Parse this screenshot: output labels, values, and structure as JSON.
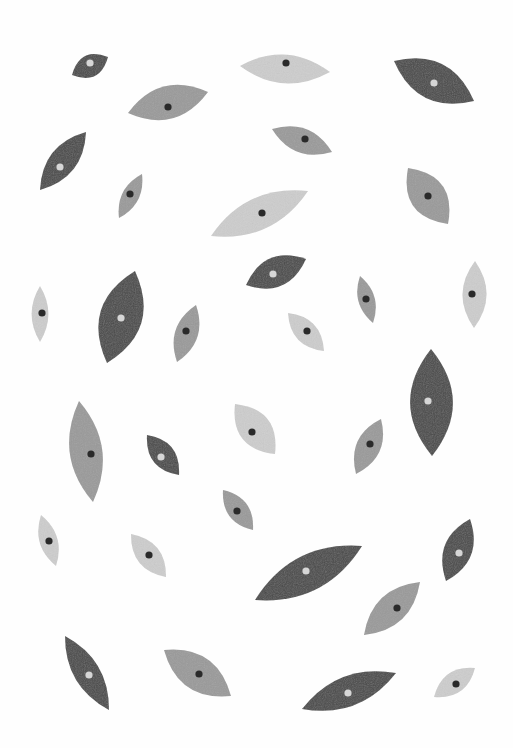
{
  "artwork": {
    "title": "Leaf-eye pattern",
    "background": "#fefefe",
    "palette": {
      "dark": "#4a4a4a",
      "mid": "#9a9a9a",
      "light": "#cdcdcd",
      "dot_dark": "#2a2a2a",
      "dot_light": "#d6d6d6"
    },
    "leaves": [
      {
        "x1": 72,
        "y1": 75,
        "x2": 108,
        "y2": 57,
        "w": 0.55,
        "tone": "dark",
        "dot": "light",
        "dx": 90,
        "dy": 63
      },
      {
        "x1": 240,
        "y1": 66,
        "x2": 330,
        "y2": 72,
        "w": 0.32,
        "tone": "light",
        "dot": "dark",
        "dx": 286,
        "dy": 63
      },
      {
        "x1": 394,
        "y1": 61,
        "x2": 474,
        "y2": 101,
        "w": 0.42,
        "tone": "dark",
        "dot": "light",
        "dx": 434,
        "dy": 83
      },
      {
        "x1": 128,
        "y1": 113,
        "x2": 208,
        "y2": 92,
        "w": 0.4,
        "tone": "mid",
        "dot": "dark",
        "dx": 168,
        "dy": 107
      },
      {
        "x1": 272,
        "y1": 129,
        "x2": 332,
        "y2": 152,
        "w": 0.38,
        "tone": "mid",
        "dot": "dark",
        "dx": 305,
        "dy": 139
      },
      {
        "x1": 40,
        "y1": 190,
        "x2": 86,
        "y2": 132,
        "w": 0.36,
        "tone": "dark",
        "dot": "light",
        "dx": 60,
        "dy": 167
      },
      {
        "x1": 119,
        "y1": 218,
        "x2": 142,
        "y2": 174,
        "w": 0.34,
        "tone": "mid",
        "dot": "dark",
        "dx": 130,
        "dy": 194
      },
      {
        "x1": 211,
        "y1": 236,
        "x2": 308,
        "y2": 191,
        "w": 0.3,
        "tone": "light",
        "dot": "dark",
        "dx": 262,
        "dy": 213
      },
      {
        "x1": 408,
        "y1": 168,
        "x2": 448,
        "y2": 224,
        "w": 0.52,
        "tone": "mid",
        "dot": "dark",
        "dx": 428,
        "dy": 196
      },
      {
        "x1": 246,
        "y1": 285,
        "x2": 306,
        "y2": 259,
        "w": 0.45,
        "tone": "dark",
        "dot": "light",
        "dx": 273,
        "dy": 274
      },
      {
        "x1": 40,
        "y1": 286,
        "x2": 40,
        "y2": 342,
        "w": 0.3,
        "tone": "light",
        "dot": "dark",
        "dx": 42,
        "dy": 313
      },
      {
        "x1": 107,
        "y1": 363,
        "x2": 135,
        "y2": 271,
        "w": 0.44,
        "tone": "dark",
        "dot": "light",
        "dx": 121,
        "dy": 318
      },
      {
        "x1": 177,
        "y1": 362,
        "x2": 196,
        "y2": 305,
        "w": 0.38,
        "tone": "mid",
        "dot": "dark",
        "dx": 186,
        "dy": 331
      },
      {
        "x1": 288,
        "y1": 313,
        "x2": 324,
        "y2": 351,
        "w": 0.42,
        "tone": "light",
        "dot": "dark",
        "dx": 307,
        "dy": 331
      },
      {
        "x1": 360,
        "y1": 276,
        "x2": 373,
        "y2": 323,
        "w": 0.34,
        "tone": "mid",
        "dot": "dark",
        "dx": 366,
        "dy": 299
      },
      {
        "x1": 475,
        "y1": 261,
        "x2": 474,
        "y2": 328,
        "w": 0.36,
        "tone": "light",
        "dot": "dark",
        "dx": 472,
        "dy": 294
      },
      {
        "x1": 79,
        "y1": 401,
        "x2": 93,
        "y2": 502,
        "w": 0.32,
        "tone": "mid",
        "dot": "dark",
        "dx": 91,
        "dy": 454
      },
      {
        "x1": 147,
        "y1": 435,
        "x2": 179,
        "y2": 475,
        "w": 0.45,
        "tone": "dark",
        "dot": "light",
        "dx": 161,
        "dy": 457
      },
      {
        "x1": 235,
        "y1": 404,
        "x2": 275,
        "y2": 454,
        "w": 0.5,
        "tone": "light",
        "dot": "dark",
        "dx": 252,
        "dy": 432
      },
      {
        "x1": 356,
        "y1": 474,
        "x2": 381,
        "y2": 419,
        "w": 0.4,
        "tone": "mid",
        "dot": "dark",
        "dx": 370,
        "dy": 444
      },
      {
        "x1": 431,
        "y1": 349,
        "x2": 432,
        "y2": 456,
        "w": 0.4,
        "tone": "dark",
        "dot": "light",
        "dx": 428,
        "dy": 401
      },
      {
        "x1": 223,
        "y1": 490,
        "x2": 253,
        "y2": 530,
        "w": 0.42,
        "tone": "mid",
        "dot": "dark",
        "dx": 237,
        "dy": 511
      },
      {
        "x1": 41,
        "y1": 515,
        "x2": 56,
        "y2": 566,
        "w": 0.34,
        "tone": "light",
        "dot": "dark",
        "dx": 49,
        "dy": 541
      },
      {
        "x1": 131,
        "y1": 534,
        "x2": 166,
        "y2": 577,
        "w": 0.42,
        "tone": "light",
        "dot": "dark",
        "dx": 149,
        "dy": 555
      },
      {
        "x1": 255,
        "y1": 600,
        "x2": 362,
        "y2": 546,
        "w": 0.3,
        "tone": "dark",
        "dot": "light",
        "dx": 306,
        "dy": 571
      },
      {
        "x1": 446,
        "y1": 581,
        "x2": 470,
        "y2": 519,
        "w": 0.42,
        "tone": "dark",
        "dot": "light",
        "dx": 459,
        "dy": 553
      },
      {
        "x1": 364,
        "y1": 635,
        "x2": 420,
        "y2": 582,
        "w": 0.38,
        "tone": "mid",
        "dot": "dark",
        "dx": 397,
        "dy": 608
      },
      {
        "x1": 65,
        "y1": 636,
        "x2": 109,
        "y2": 710,
        "w": 0.3,
        "tone": "dark",
        "dot": "light",
        "dx": 89,
        "dy": 675
      },
      {
        "x1": 164,
        "y1": 650,
        "x2": 231,
        "y2": 696,
        "w": 0.42,
        "tone": "mid",
        "dot": "dark",
        "dx": 199,
        "dy": 674
      },
      {
        "x1": 302,
        "y1": 709,
        "x2": 396,
        "y2": 673,
        "w": 0.3,
        "tone": "dark",
        "dot": "light",
        "dx": 348,
        "dy": 693
      },
      {
        "x1": 434,
        "y1": 697,
        "x2": 475,
        "y2": 668,
        "w": 0.42,
        "tone": "light",
        "dot": "dark",
        "dx": 456,
        "dy": 684
      }
    ]
  }
}
